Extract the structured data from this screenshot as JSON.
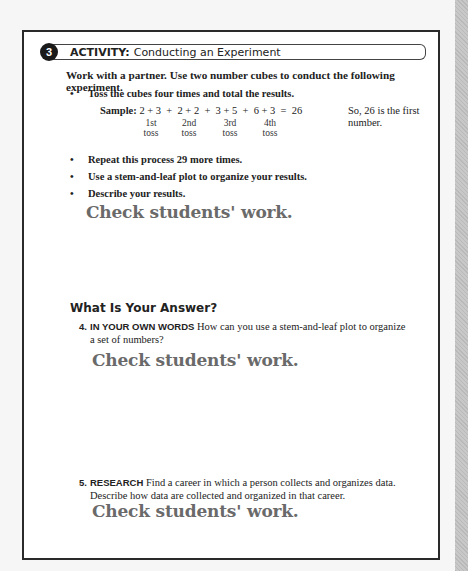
{
  "activity": {
    "number": "3",
    "label": "ACTIVITY:",
    "title": "Conducting an Experiment",
    "intro": "Work with a partner. Use two number cubes to conduct the following experiment.",
    "steps": [
      "Toss the cubes four times and total the results.",
      "Repeat this process 29 more times.",
      "Use a stem-and-leaf plot to organize your results.",
      "Describe your results."
    ],
    "sample": {
      "label": "Sample:",
      "expression": "2 + 3  +  2 + 2  +  3 + 5  +  6 + 3  =  26",
      "tosses": [
        {
          "ordinal": "1st",
          "word": "toss"
        },
        {
          "ordinal": "2nd",
          "word": "toss"
        },
        {
          "ordinal": "3rd",
          "word": "toss"
        },
        {
          "ordinal": "4th",
          "word": "toss"
        }
      ],
      "note": "So, 26 is the first number."
    },
    "answer": "Check students' work."
  },
  "answer_section": {
    "title": "What Is Your Answer?",
    "questions": [
      {
        "number": "4.",
        "label": "IN YOUR OWN WORDS",
        "text": "How can you use a stem-and-leaf plot to organize a set of numbers?",
        "answer": "Check students' work."
      },
      {
        "number": "5.",
        "label": "RESEARCH",
        "text": "Find a career in which a person collects and organizes data. Describe how data are collected and organized in that career.",
        "answer": "Check students' work."
      }
    ]
  }
}
